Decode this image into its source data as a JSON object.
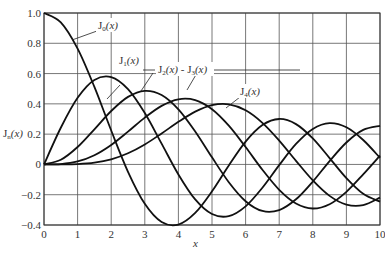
{
  "chart_data": {
    "type": "line",
    "title": "",
    "xlabel": "x",
    "ylabel": "J_n(x)",
    "xlim": [
      0,
      10
    ],
    "ylim": [
      -0.4,
      1.0
    ],
    "grid": true,
    "x_ticks": [
      "0",
      "1",
      "2",
      "3",
      "4",
      "5",
      "6",
      "7",
      "8",
      "9",
      "10"
    ],
    "y_ticks": [
      "1.0",
      "0.8",
      "0.6",
      "0.4",
      "0.2",
      "0",
      "−0.2",
      "−0.4"
    ],
    "x": [
      0,
      0.5,
      1,
      1.5,
      2,
      2.5,
      3,
      3.5,
      4,
      4.5,
      5,
      5.5,
      6,
      6.5,
      7,
      7.5,
      8,
      8.5,
      9,
      9.5,
      10
    ],
    "series": [
      {
        "name": "J0(x)",
        "values": [
          1,
          0.9385,
          0.7652,
          0.5118,
          0.2239,
          -0.0484,
          -0.2601,
          -0.3801,
          -0.3971,
          -0.3205,
          -0.1776,
          -0.0068,
          0.1506,
          0.2601,
          0.3001,
          0.2663,
          0.1717,
          0.0419,
          -0.0903,
          -0.1939,
          -0.2459
        ]
      },
      {
        "name": "J1(x)",
        "values": [
          0,
          0.2423,
          0.4401,
          0.5579,
          0.5767,
          0.4971,
          0.3391,
          0.1374,
          -0.066,
          -0.2311,
          -0.3276,
          -0.3414,
          -0.2767,
          -0.1538,
          -0.0047,
          0.1352,
          0.2346,
          0.2731,
          0.2453,
          0.1613,
          0.0435
        ]
      },
      {
        "name": "J2(x)",
        "values": [
          0,
          0.0306,
          0.1149,
          0.2321,
          0.3528,
          0.4461,
          0.4861,
          0.4586,
          0.3641,
          0.2178,
          0.0466,
          -0.1173,
          -0.2429,
          -0.3074,
          -0.3014,
          -0.2303,
          -0.113,
          0.0223,
          0.1448,
          0.2279,
          0.2546
        ]
      },
      {
        "name": "J3(x)",
        "values": [
          0,
          0.0026,
          0.0196,
          0.061,
          0.1289,
          0.2166,
          0.3091,
          0.3868,
          0.4302,
          0.4247,
          0.3648,
          0.2561,
          0.1148,
          -0.0353,
          -0.1676,
          -0.2581,
          -0.2911,
          -0.2626,
          -0.1809,
          -0.0653,
          0.0584
        ]
      },
      {
        "name": "J4(x)",
        "values": [
          0,
          0.0002,
          0.0025,
          0.0118,
          0.034,
          0.0738,
          0.132,
          0.2044,
          0.2811,
          0.3484,
          0.3912,
          0.3967,
          0.3576,
          0.2748,
          0.1578,
          0.0238,
          -0.1054,
          -0.2077,
          -0.2655,
          -0.2691,
          -0.2196
        ]
      }
    ],
    "annotations": [
      {
        "text": "J0(x)",
        "points_to": "J0(x)"
      },
      {
        "text": "J1(x)",
        "points_to": "J1(x)"
      },
      {
        "text": "J2(x) - J3(x)",
        "points_to": [
          "J2(x)",
          "J3(x)"
        ]
      },
      {
        "text": "J4(x)",
        "points_to": "J4(x)"
      }
    ]
  },
  "labels": {
    "ylabel_main": "J",
    "ylabel_sub": "n",
    "ylabel_tail": "(x)",
    "xlabel": "x",
    "j0_main": "J",
    "j0_sub": "0",
    "j0_tail": "(x)",
    "j1_main": "J",
    "j1_sub": "1",
    "j1_tail": "(x)",
    "j23_a_main": "J",
    "j23_a_sub": "2",
    "j23_a_tail": "(x)",
    "j23_sep": " - ",
    "j23_b_main": "J",
    "j23_b_sub": "3",
    "j23_b_tail": "(x)",
    "j4_main": "J",
    "j4_sub": "4",
    "j4_tail": "(x)"
  }
}
